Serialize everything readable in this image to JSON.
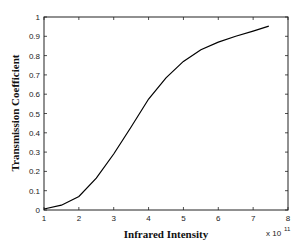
{
  "chart_data": {
    "type": "line",
    "title": "",
    "xlabel": "Infrared Intensity",
    "ylabel": "Transmission Coefficient",
    "x_multiplier_label": "x 10",
    "x_multiplier_exponent": "11",
    "xlim": [
      1,
      8
    ],
    "ylim": [
      0,
      1
    ],
    "grid": false,
    "legend": null,
    "x_ticks": [
      "1",
      "2",
      "3",
      "4",
      "5",
      "6",
      "7",
      "8"
    ],
    "y_ticks": [
      "0",
      "0.1",
      "0.2",
      "0.3",
      "0.4",
      "0.5",
      "0.6",
      "0.7",
      "0.8",
      "0.9",
      "1"
    ],
    "series": [
      {
        "name": "Transmission Coefficient",
        "color": "#000000",
        "x": [
          1.0,
          1.5,
          2.0,
          2.5,
          3.0,
          3.5,
          4.0,
          4.5,
          5.0,
          5.5,
          6.0,
          6.5,
          7.0,
          7.45
        ],
        "y": [
          0.005,
          0.025,
          0.07,
          0.165,
          0.29,
          0.43,
          0.575,
          0.685,
          0.77,
          0.83,
          0.87,
          0.9,
          0.927,
          0.953
        ]
      }
    ]
  }
}
